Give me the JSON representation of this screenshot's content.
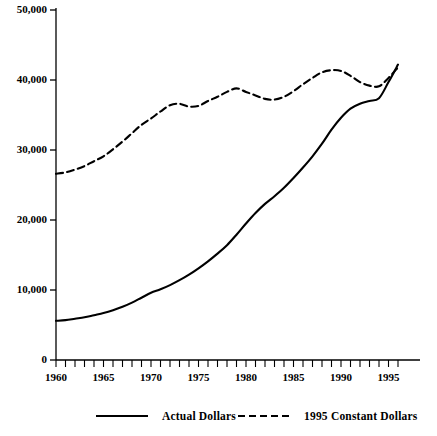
{
  "chart_data": {
    "type": "line",
    "title": "",
    "subtitle": "",
    "xlabel": "",
    "ylabel": "",
    "xlim": [
      1960,
      1996
    ],
    "ylim": [
      0,
      50000
    ],
    "grid": false,
    "legend_position": "bottom",
    "y_ticks": [
      0,
      10000,
      20000,
      30000,
      40000,
      50000
    ],
    "y_tick_labels": [
      "0",
      "10,000",
      "20,000",
      "30,000",
      "40,000",
      "50,000"
    ],
    "x_ticks": [
      1960,
      1961,
      1962,
      1963,
      1964,
      1965,
      1966,
      1967,
      1968,
      1969,
      1970,
      1971,
      1972,
      1973,
      1974,
      1975,
      1976,
      1977,
      1978,
      1979,
      1980,
      1981,
      1982,
      1983,
      1984,
      1985,
      1986,
      1987,
      1988,
      1989,
      1990,
      1991,
      1992,
      1993,
      1994,
      1995,
      1996
    ],
    "x_tick_labels": [
      "1960",
      "1965",
      "1970",
      "1975",
      "1980",
      "1985",
      "1990",
      "1995"
    ],
    "x_labeled_ticks": [
      1960,
      1965,
      1970,
      1975,
      1980,
      1985,
      1990,
      1995
    ],
    "x": [
      1960,
      1961,
      1962,
      1963,
      1964,
      1965,
      1966,
      1967,
      1968,
      1969,
      1970,
      1971,
      1972,
      1973,
      1974,
      1975,
      1976,
      1977,
      1978,
      1979,
      1980,
      1981,
      1982,
      1983,
      1984,
      1985,
      1986,
      1987,
      1988,
      1989,
      1990,
      1991,
      1992,
      1993,
      1994,
      1995,
      1996
    ],
    "series": [
      {
        "name": "Actual Dollars",
        "style": "solid",
        "color": "#000000",
        "values": [
          5600,
          5700,
          5900,
          6100,
          6400,
          6700,
          7100,
          7600,
          8200,
          8900,
          9600,
          10100,
          10700,
          11400,
          12200,
          13100,
          14100,
          15200,
          16400,
          17900,
          19500,
          21000,
          22300,
          23400,
          24600,
          26000,
          27500,
          29100,
          30900,
          32900,
          34600,
          35900,
          36600,
          37000,
          37400,
          39700,
          42200
        ]
      },
      {
        "name": "1995 Constant Dollars",
        "style": "dashed",
        "color": "#000000",
        "values": [
          26600,
          26800,
          27200,
          27700,
          28400,
          29100,
          30100,
          31200,
          32400,
          33600,
          34500,
          35500,
          36400,
          36600,
          36200,
          36300,
          37000,
          37600,
          38300,
          38800,
          38300,
          37800,
          37300,
          37200,
          37600,
          38400,
          39400,
          40300,
          41100,
          41400,
          41300,
          40600,
          39700,
          39200,
          39100,
          40300,
          41800
        ]
      }
    ],
    "legend": [
      {
        "label": "Actual Dollars",
        "style": "solid"
      },
      {
        "label": "1995 Constant Dollars",
        "style": "dashed"
      }
    ],
    "axis_color": "#000000"
  }
}
